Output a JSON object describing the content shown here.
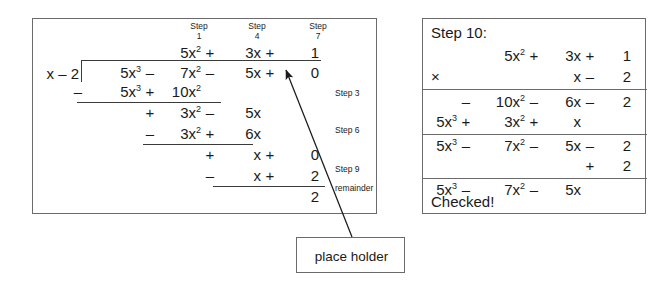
{
  "diagram": {
    "ink_color": "#1a1a1a",
    "rule_color": "#3a3a3a",
    "border_color": "#6b6b6b",
    "background": "#ffffff"
  },
  "division": {
    "divisor": "x – 2",
    "step_labels": [
      {
        "name": "Step",
        "number": "1"
      },
      {
        "name": "Step",
        "number": "4"
      },
      {
        "name": "Step",
        "number": "7"
      }
    ],
    "quotient": {
      "t1": "5x",
      "t1_exp": "2",
      "op1": "+",
      "t2": "3x",
      "op2": "+",
      "t3": "1"
    },
    "dividend": {
      "t1": "5x",
      "t1_exp": "3",
      "op1": "–",
      "t2": "7x",
      "t2_exp": "2",
      "op2": "–",
      "t3": "5x",
      "op3": "+",
      "t4": "0"
    },
    "subtract_1": {
      "sign": "–",
      "t1": "5x",
      "t1_exp": "3",
      "op1": "+",
      "t2": "10x",
      "t2_exp": "2"
    },
    "bring_down_1": {
      "sign": "+",
      "t1": "3x",
      "t1_exp": "2",
      "op1": "–",
      "t2": "5x"
    },
    "subtract_2": {
      "sign": "–",
      "t1": "3x",
      "t1_exp": "2",
      "op1": "+",
      "t2": "6x"
    },
    "bring_down_2": {
      "sign": "+",
      "t1": "x",
      "op1": "+",
      "t2": "0"
    },
    "subtract_3": {
      "sign": "–",
      "t1": "x",
      "op1": "+",
      "t2": "2"
    },
    "remainder_value": "2",
    "side_labels": [
      {
        "text": "Step 3"
      },
      {
        "text": "Step 6"
      },
      {
        "text": "Step 9"
      },
      {
        "text": "remainder"
      }
    ]
  },
  "callout": {
    "label": "place holder"
  },
  "check": {
    "heading": "Step 10:",
    "multiply_symbol": "×",
    "factor_top": {
      "t1": "5x",
      "t1_exp": "2",
      "op1": "+",
      "t2": "3x",
      "op2": "+",
      "t3": "1"
    },
    "factor_bottom": {
      "t1": "x",
      "op1": "–",
      "t2": "2"
    },
    "partial_1": {
      "op0": "–",
      "t1": "10x",
      "t1_exp": "2",
      "op1": "–",
      "t2": "6x",
      "op2": "–",
      "t3": "2"
    },
    "partial_2": {
      "t0": "5x",
      "t0_exp": "3",
      "op1": "+",
      "t1": "3x",
      "t1_exp": "2",
      "op2": "+",
      "t2": "x"
    },
    "product": {
      "t0": "5x",
      "t0_exp": "3",
      "op1": "–",
      "t1": "7x",
      "t1_exp": "2",
      "op2": "–",
      "t2": "5x",
      "op3": "–",
      "t3": "2"
    },
    "add_remainder": {
      "op": "+",
      "value": "2"
    },
    "result": {
      "t0": "5x",
      "t0_exp": "3",
      "op1": "–",
      "t1": "7x",
      "t1_exp": "2",
      "op2": "–",
      "t2": "5x"
    },
    "conclusion": "Checked!"
  }
}
